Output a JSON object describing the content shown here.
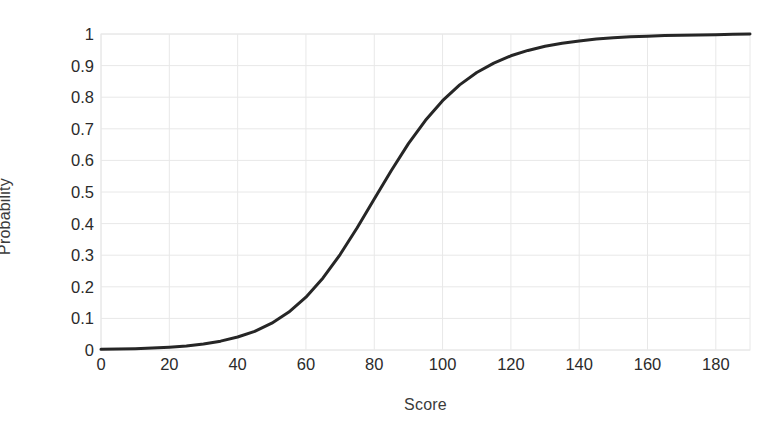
{
  "chart_data": {
    "type": "line",
    "title": "",
    "subtitle": "",
    "xlabel": "Score",
    "ylabel": "Probability",
    "xlim": [
      0,
      190
    ],
    "ylim": [
      0,
      1
    ],
    "grid": true,
    "legend": false,
    "legend_position": "none",
    "xticks": [
      0,
      20,
      40,
      60,
      80,
      100,
      120,
      140,
      160,
      180
    ],
    "xtick_labels": [
      "0",
      "20",
      "40",
      "60",
      "80",
      "100",
      "120",
      "140",
      "160",
      "180"
    ],
    "yticks": [
      0,
      0.1,
      0.2,
      0.3,
      0.4,
      0.5,
      0.6,
      0.7,
      0.8,
      0.9,
      1
    ],
    "ytick_labels": [
      "0",
      "0.1",
      "0.2",
      "0.3",
      "0.4",
      "0.5",
      "0.6",
      "0.7",
      "0.8",
      "0.9",
      "1"
    ],
    "annotations": [],
    "series": [
      {
        "name": "Probability",
        "color": "#262626",
        "line_width": 3,
        "x": [
          0,
          5,
          10,
          15,
          20,
          25,
          30,
          35,
          40,
          45,
          50,
          55,
          60,
          65,
          70,
          75,
          80,
          85,
          90,
          95,
          100,
          105,
          110,
          115,
          120,
          125,
          130,
          135,
          140,
          145,
          150,
          155,
          160,
          165,
          170,
          175,
          180,
          185,
          190
        ],
        "values": [
          0.002,
          0.003,
          0.004,
          0.006,
          0.009,
          0.013,
          0.019,
          0.028,
          0.041,
          0.059,
          0.085,
          0.12,
          0.167,
          0.228,
          0.302,
          0.387,
          0.478,
          0.568,
          0.653,
          0.727,
          0.789,
          0.839,
          0.878,
          0.908,
          0.931,
          0.948,
          0.961,
          0.971,
          0.978,
          0.984,
          0.988,
          0.991,
          0.993,
          0.995,
          0.996,
          0.997,
          0.998,
          0.999,
          1.0
        ]
      }
    ]
  },
  "axes": {
    "x_title": "Score",
    "y_title": "Probability"
  },
  "style": {
    "background": "#ffffff",
    "gridline_color": "#e8e8e8",
    "axis_text_color": "#2b2b2b",
    "curve_color": "#262626"
  }
}
